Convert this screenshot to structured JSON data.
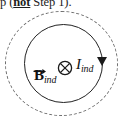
{
  "figure": {
    "name": "induced-magnetic-field-diagram",
    "caption_fragment": {
      "before": "p (",
      "emphasis": "not",
      "after": " Step 1)."
    },
    "labels": {
      "b_field_symbol": "B",
      "b_field_subscript": "ind",
      "current_symbol": "I",
      "current_subscript": "ind",
      "field_direction_icon": "circle-cross-into-page-icon"
    },
    "colors": {
      "solid_loop": "#222222",
      "dashed_region": "#6e6e6e",
      "text": "#121212",
      "background": "#ffffff"
    },
    "geometry": {
      "outer_dashed_circle": {
        "cx": 61,
        "cy": 63,
        "rx": 56,
        "ry": 52
      },
      "inner_solid_circle": {
        "cx": 63,
        "cy": 63,
        "r": 39
      },
      "current_direction": "clockwise"
    }
  }
}
